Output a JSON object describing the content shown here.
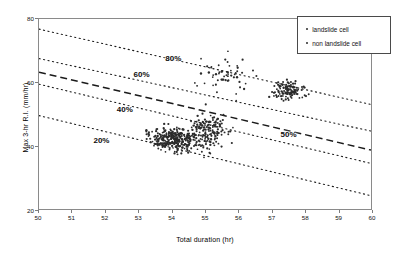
{
  "chart_data": {
    "type": "scatter",
    "title": "",
    "xlabel": "Total duration  (hr)",
    "ylabel": "Max 3-hr R.I.   (mm/hr)",
    "xlim": [
      50,
      60
    ],
    "ylim": [
      20,
      80
    ],
    "xticks": [
      50,
      51,
      52,
      53,
      54,
      55,
      56,
      57,
      58,
      59,
      60
    ],
    "yticks": [
      20,
      40,
      60,
      80
    ],
    "grid": false,
    "legend_position": "top-right",
    "series": [
      {
        "name": "landslide cell",
        "marker": "dot",
        "color": "#2b2b2b",
        "n_points": 620,
        "clusters": [
          {
            "x_mean": 54.1,
            "x_sd": 0.62,
            "y_mean": 42.0,
            "y_sd": 3.4,
            "n": 300
          },
          {
            "x_mean": 55.1,
            "x_sd": 0.45,
            "y_mean": 44.5,
            "y_sd": 5.0,
            "n": 150
          },
          {
            "x_mean": 57.5,
            "x_sd": 0.42,
            "y_mean": 57.5,
            "y_sd": 2.6,
            "n": 115
          },
          {
            "x_mean": 55.6,
            "x_sd": 0.75,
            "y_mean": 62.0,
            "y_sd": 6.0,
            "n": 55
          }
        ]
      },
      {
        "name": "non landslide cell",
        "marker": "dot",
        "color": "#2b2b2b",
        "n_points": 0,
        "clusters": []
      }
    ],
    "contours": [
      {
        "label": "80%",
        "style": "dotted",
        "x0": 50,
        "y0": 76.8,
        "x1": 60,
        "y1": 53.0,
        "label_x": 54.05,
        "label_y": 67.5
      },
      {
        "label": "60%",
        "style": "dotted",
        "x0": 50,
        "y0": 67.5,
        "x1": 60,
        "y1": 44.6,
        "label_x": 53.1,
        "label_y": 62.4
      },
      {
        "label": "50%",
        "style": "dashed",
        "x0": 50,
        "y0": 63.2,
        "x1": 60,
        "y1": 38.6,
        "label_x": 57.5,
        "label_y": 43.6
      },
      {
        "label": "40%",
        "style": "dotted",
        "x0": 50,
        "y0": 59.4,
        "x1": 60,
        "y1": 34.4,
        "label_x": 52.6,
        "label_y": 51.5
      },
      {
        "label": "20%",
        "style": "dotted",
        "x0": 50,
        "y0": 49.5,
        "x1": 60,
        "y1": 24.2,
        "label_x": 51.9,
        "label_y": 42.0
      }
    ]
  },
  "legend": {
    "items": [
      {
        "label": "landslide cell"
      },
      {
        "label": "non landslide cell"
      }
    ]
  }
}
